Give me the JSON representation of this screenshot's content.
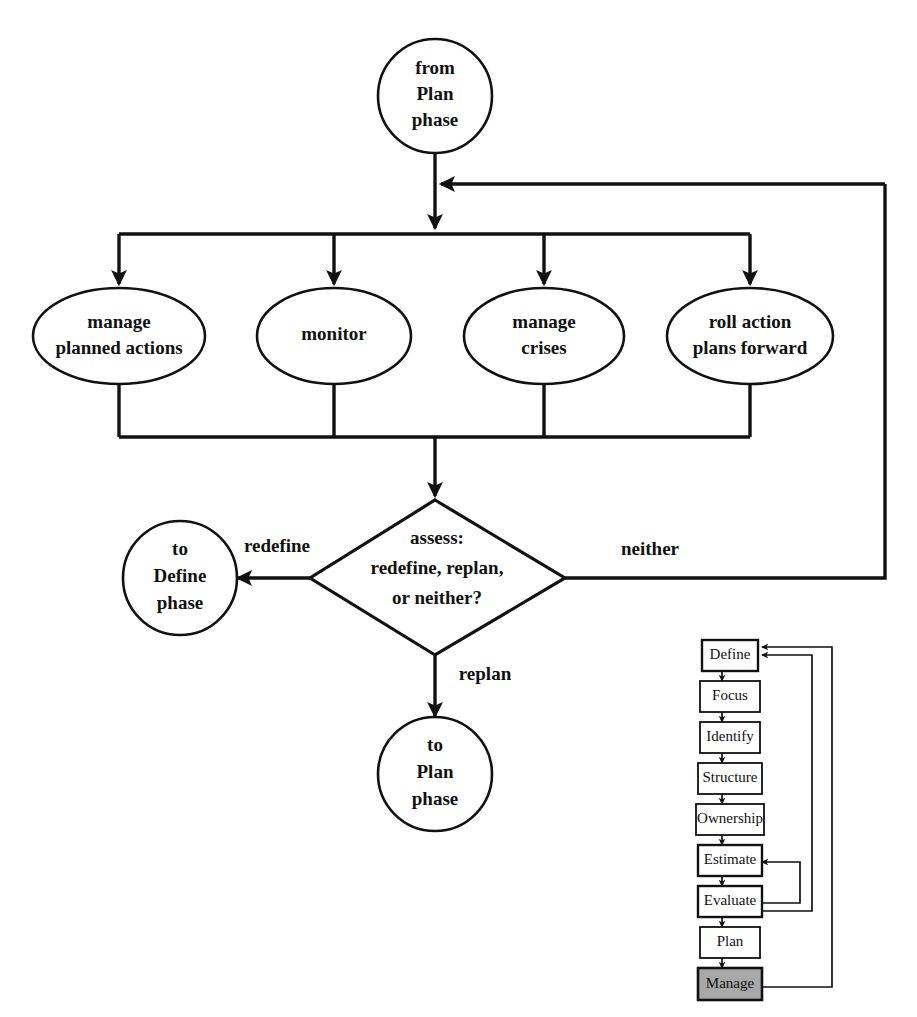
{
  "diagram": {
    "nodes": {
      "start": {
        "shape": "circle",
        "lines": [
          "from",
          "Plan",
          "phase"
        ]
      },
      "activity_1": {
        "shape": "ellipse",
        "lines": [
          "manage",
          "planned actions"
        ]
      },
      "activity_2": {
        "shape": "ellipse",
        "lines": [
          "monitor"
        ]
      },
      "activity_3": {
        "shape": "ellipse",
        "lines": [
          "manage",
          "crises"
        ]
      },
      "activity_4": {
        "shape": "ellipse",
        "lines": [
          "roll action",
          "plans forward"
        ]
      },
      "decision": {
        "shape": "diamond",
        "lines": [
          "assess:",
          "redefine, replan,",
          "or neither?"
        ]
      },
      "exit_define": {
        "shape": "circle",
        "lines": [
          "to",
          "Define",
          "phase"
        ]
      },
      "exit_plan": {
        "shape": "circle",
        "lines": [
          "to",
          "Plan",
          "phase"
        ]
      }
    },
    "edge_labels": {
      "redefine": "redefine",
      "replan": "replan",
      "neither": "neither"
    },
    "colors": {
      "line": "#111111",
      "fill": "#ffffff",
      "highlight": "#a8a8a8"
    }
  },
  "mini_process": {
    "name": "risk management process overview",
    "steps": [
      {
        "label": "Define",
        "highlighted": false
      },
      {
        "label": "Focus",
        "highlighted": false
      },
      {
        "label": "Identify",
        "highlighted": false
      },
      {
        "label": "Structure",
        "highlighted": false
      },
      {
        "label": "Ownership",
        "highlighted": false
      },
      {
        "label": "Estimate",
        "highlighted": false
      },
      {
        "label": "Evaluate",
        "highlighted": false
      },
      {
        "label": "Plan",
        "highlighted": false
      },
      {
        "label": "Manage",
        "highlighted": true
      }
    ]
  }
}
